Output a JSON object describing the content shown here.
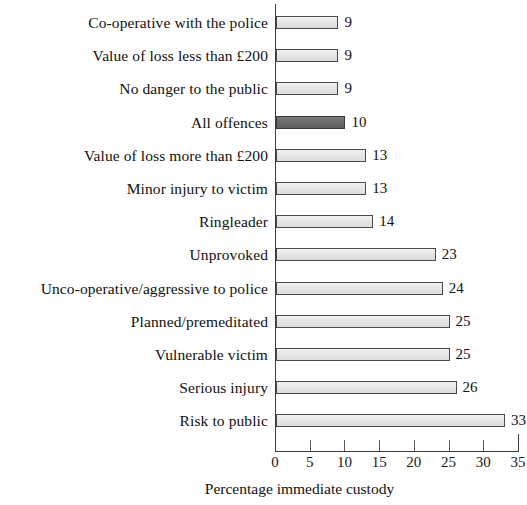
{
  "chart_data": {
    "type": "bar",
    "orientation": "horizontal",
    "title": "",
    "subtitle": "",
    "xlabel": "Percentage immediate custody",
    "ylabel": "",
    "xlim": [
      0,
      35
    ],
    "xticks": [
      0,
      5,
      10,
      15,
      20,
      25,
      30,
      35
    ],
    "xtick_labels": [
      "0",
      "5",
      "10",
      "15",
      "20",
      "25",
      "30",
      "35"
    ],
    "grid": false,
    "legend": null,
    "categories": [
      "Co-operative with the police",
      "Value of loss less than £200",
      "No danger to the public",
      "All offences",
      "Value of loss more than £200",
      "Minor injury to victim",
      "Ringleader",
      "Unprovoked",
      "Unco-operative/aggressive to police",
      "Planned/premeditated",
      "Vulnerable victim",
      "Serious injury",
      "Risk to public"
    ],
    "values": [
      9,
      9,
      9,
      10,
      13,
      13,
      14,
      23,
      24,
      25,
      25,
      26,
      33
    ],
    "data_labels": [
      "9",
      "9",
      "9",
      "10",
      "13",
      "13",
      "14",
      "23",
      "24",
      "25",
      "25",
      "26",
      "33"
    ],
    "highlight_index": 3,
    "colors": {
      "bar_fill": "#e3e3e3",
      "bar_border": "#4a4a4a",
      "highlight_fill": "#6b6b6b",
      "highlight_border": "#3a3a3a",
      "axis": "#3c3c3c",
      "text": "#111111",
      "background": "#ffffff"
    }
  }
}
